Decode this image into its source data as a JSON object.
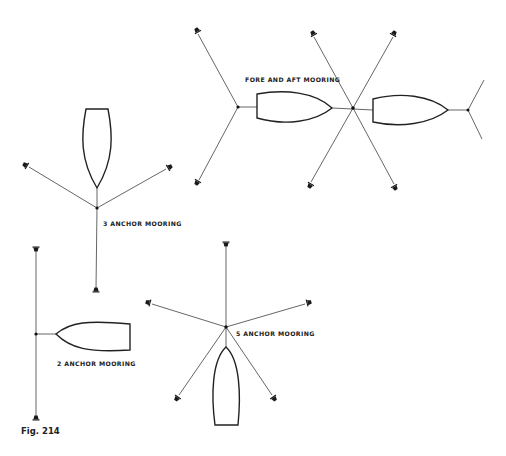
{
  "figure": {
    "caption": "Fig. 214"
  },
  "diagrams": [
    {
      "id": "fore-and-aft",
      "label": "FORE AND AFT MOORING",
      "label_pos": [
        245,
        81
      ]
    },
    {
      "id": "three-anchor",
      "label": "3 ANCHOR MOORING",
      "label_pos": [
        103,
        225
      ]
    },
    {
      "id": "two-anchor",
      "label": "2 ANCHOR MOORING",
      "label_pos": [
        57,
        365
      ]
    },
    {
      "id": "five-anchor",
      "label": "5 ANCHOR MOORING",
      "label_pos": [
        236,
        335
      ]
    }
  ]
}
